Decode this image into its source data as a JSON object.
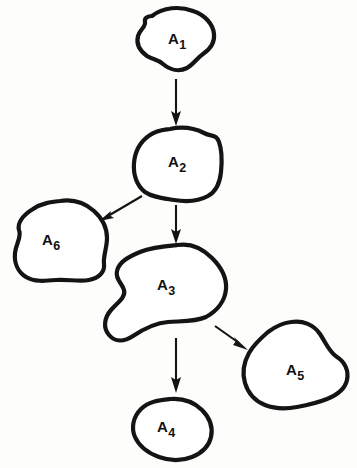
{
  "diagram": {
    "style": {
      "background_color": "#fdfdfc",
      "shape_fill": "#ffffff",
      "shape_stroke": "#141414",
      "arrow_color": "#141414",
      "label_color": "#101010"
    },
    "nodes": [
      {
        "id": "A1",
        "base": "A",
        "subscript": "1",
        "label": "A1",
        "label_x": 168,
        "label_y": 44,
        "cx": 175,
        "cy": 39,
        "path": "M 152 16 C 163 7, 180 6, 193 11 C 205 15, 213 24, 214 34 C 215 44, 209 50, 203 54 C 197 58, 194 64, 187 68 C 179 72, 170 70, 163 64 C 157 59, 153 60, 147 56 C 140 51, 136 44, 138 36 C 140 29, 146 27, 145 22 C 144 18, 148 16, 152 16 Z"
      },
      {
        "id": "A2",
        "base": "A",
        "subscript": "2",
        "label": "A2",
        "label_x": 168,
        "label_y": 167,
        "cx": 177,
        "cy": 164,
        "path": "M 170 129 C 184 126, 196 129, 204 133 C 212 137, 216 134, 219 142 C 222 150, 222 162, 221 172 C 220 182, 217 191, 208 196 C 199 201, 186 202, 174 200 C 162 198, 152 197, 145 192 C 137 186, 133 175, 134 163 C 135 151, 141 141, 150 135 C 157 130, 163 130, 170 129 Z"
      },
      {
        "id": "A3",
        "base": "A",
        "subscript": "3",
        "label": "A3",
        "label_x": 157,
        "label_y": 290,
        "cx": 168,
        "cy": 292,
        "path": "M 178 245 C 192 243, 203 249, 212 258 C 221 267, 227 277, 226 289 C 225 301, 217 311, 206 317 C 195 322, 181 321, 168 322 C 155 323, 145 328, 133 336 C 124 342, 115 342, 109 335 C 103 328, 104 318, 111 310 C 118 302, 126 297, 124 290 C 122 283, 115 279, 117 271 C 119 262, 128 257, 140 252 C 152 247, 166 246, 178 245 Z"
      },
      {
        "id": "A4",
        "base": "A",
        "subscript": "4",
        "label": "A4",
        "label_x": 157,
        "label_y": 432,
        "cx": 171,
        "cy": 428,
        "path": "M 170 399 C 182 398, 194 402, 202 410 C 210 418, 213 428, 211 437 C 209 446, 202 453, 192 457 C 182 461, 170 461, 159 457 C 148 453, 139 446, 135 437 C 131 428, 133 417, 141 409 C 149 401, 160 400, 170 399 Z"
      },
      {
        "id": "A5",
        "base": "A",
        "subscript": "5",
        "label": "A5",
        "label_x": 286,
        "label_y": 375,
        "cx": 295,
        "cy": 366,
        "path": "M 291 322 C 303 320, 314 325, 320 334 C 326 343, 329 352, 337 357 C 345 362, 349 371, 347 380 C 345 389, 337 395, 327 399 C 317 403, 308 405, 297 407 C 286 409, 275 409, 265 405 C 255 401, 248 393, 245 383 C 242 373, 244 362, 249 353 C 254 344, 261 338, 268 332 C 276 326, 283 323, 291 322 Z"
      },
      {
        "id": "A6",
        "base": "A",
        "subscript": "6",
        "label": "A6",
        "label_x": 42,
        "label_y": 245,
        "cx": 57,
        "cy": 241,
        "path": "M 60 201 C 73 199, 85 203, 94 211 C 103 219, 107 228, 107 238 C 107 248, 103 256, 104 264 C 105 272, 99 278, 89 280 C 79 282, 67 279, 56 280 C 45 281, 34 282, 26 277 C 18 272, 14 263, 15 253 C 16 243, 22 237, 19 230 C 17 223, 23 215, 33 209 C 42 203, 51 202, 60 201 Z"
      }
    ],
    "edges": [
      {
        "id": "edge-a1-a2",
        "from": "A1",
        "to": "A2",
        "line": "M 176 79 L 176 116",
        "head": "M 176 126 L 171.0 111 L 176 114 L 181.0 111 Z"
      },
      {
        "id": "edge-a2-a6",
        "from": "A2",
        "to": "A6",
        "line": "M 142 196 L 108 216",
        "head": "M 99 221 L 111 211 L 110 215.5 L 114 218 Z"
      },
      {
        "id": "edge-a2-a3",
        "from": "A2",
        "to": "A3",
        "line": "M 176 205 L 176 234",
        "head": "M 176 244 L 171.0 229 L 176 232 L 181.0 229 Z"
      },
      {
        "id": "edge-a3-a4",
        "from": "A3",
        "to": "A4",
        "line": "M 176 338 L 176 382",
        "head": "M 176 393 L 171.0 377 L 176 380 L 181.0 377 Z"
      },
      {
        "id": "edge-a3-a5",
        "from": "A3",
        "to": "A5",
        "line": "M 215 326 L 239 343",
        "head": "M 248 350 L 233 345 L 236 341 L 234 337 Z"
      }
    ]
  }
}
